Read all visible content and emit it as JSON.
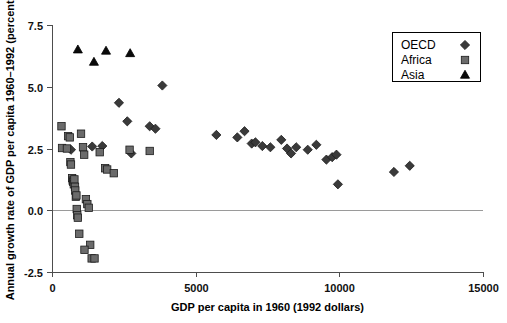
{
  "chart_data": {
    "type": "scatter",
    "title": "",
    "xlabel": "GDP per capita in 1960 (1992 dollars)",
    "ylabel": "Annual growth rate of GDP per capita 1960–1992 (percent)",
    "xlim": [
      0,
      15000
    ],
    "ylim": [
      -2.5,
      7.5
    ],
    "xticks": [
      0,
      5000,
      10000,
      15000
    ],
    "xticklabels": [
      "0",
      "5000",
      "10000",
      "15000"
    ],
    "yticks": [
      -2.5,
      0.0,
      2.5,
      5.0,
      7.5
    ],
    "yticklabels": [
      "-2.5",
      "0.0",
      "2.5",
      "5.0",
      "7.5"
    ],
    "grid": false,
    "zero_reference_line": 0.0,
    "legend_position": "top-right",
    "series": [
      {
        "name": "OECD",
        "marker": "diamond",
        "color": "#3a3a3a",
        "points": [
          [
            660,
            2.45
          ],
          [
            1400,
            2.58
          ],
          [
            1750,
            2.6
          ],
          [
            2330,
            4.35
          ],
          [
            2620,
            3.6
          ],
          [
            2760,
            2.3
          ],
          [
            3400,
            3.4
          ],
          [
            3600,
            3.3
          ],
          [
            3840,
            5.05
          ],
          [
            5720,
            3.05
          ],
          [
            6450,
            2.95
          ],
          [
            6700,
            3.2
          ],
          [
            6950,
            2.7
          ],
          [
            7080,
            2.75
          ],
          [
            7320,
            2.6
          ],
          [
            7600,
            2.55
          ],
          [
            7980,
            2.85
          ],
          [
            8180,
            2.5
          ],
          [
            8320,
            2.3
          ],
          [
            8500,
            2.55
          ],
          [
            8900,
            2.45
          ],
          [
            9200,
            2.65
          ],
          [
            9550,
            2.05
          ],
          [
            9750,
            2.15
          ],
          [
            9900,
            2.25
          ],
          [
            9950,
            1.05
          ],
          [
            11900,
            1.55
          ],
          [
            12450,
            1.8
          ]
        ]
      },
      {
        "name": "Africa",
        "marker": "square",
        "color": "#6b6b6b",
        "points": [
          [
            330,
            3.4
          ],
          [
            350,
            2.52
          ],
          [
            520,
            2.5
          ],
          [
            560,
            3.0
          ],
          [
            620,
            2.95
          ],
          [
            640,
            1.95
          ],
          [
            660,
            1.85
          ],
          [
            700,
            1.3
          ],
          [
            720,
            1.2
          ],
          [
            740,
            1.15
          ],
          [
            760,
            1.05
          ],
          [
            780,
            1.25
          ],
          [
            800,
            0.95
          ],
          [
            810,
            0.8
          ],
          [
            830,
            0.55
          ],
          [
            850,
            0.6
          ],
          [
            860,
            0.05
          ],
          [
            880,
            -0.2
          ],
          [
            900,
            -0.3
          ],
          [
            950,
            -0.95
          ],
          [
            1010,
            3.1
          ],
          [
            1080,
            2.55
          ],
          [
            1120,
            2.25
          ],
          [
            1180,
            0.45
          ],
          [
            1230,
            0.25
          ],
          [
            1280,
            0.1
          ],
          [
            1330,
            -1.4
          ],
          [
            1380,
            -1.95
          ],
          [
            1130,
            -1.6
          ],
          [
            1480,
            -1.95
          ],
          [
            1660,
            2.35
          ],
          [
            1850,
            1.7
          ],
          [
            1920,
            1.65
          ],
          [
            2150,
            1.5
          ],
          [
            2700,
            2.45
          ],
          [
            3400,
            2.4
          ]
        ]
      },
      {
        "name": "Asia",
        "marker": "triangle",
        "color": "#0a0a0a",
        "points": [
          [
            900,
            6.5
          ],
          [
            1460,
            6.0
          ],
          [
            1880,
            6.45
          ],
          [
            2720,
            6.35
          ]
        ]
      }
    ]
  },
  "legend": {
    "entries": [
      {
        "label": "OECD",
        "marker": "diamond-icon"
      },
      {
        "label": "Africa",
        "marker": "square-icon"
      },
      {
        "label": "Asia",
        "marker": "triangle-icon"
      }
    ]
  }
}
